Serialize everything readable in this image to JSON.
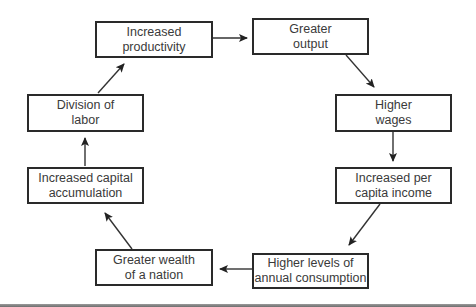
{
  "diagram": {
    "type": "cycle",
    "nodes": [
      {
        "id": "productivity",
        "lines": [
          "Increased",
          "productivity"
        ]
      },
      {
        "id": "output",
        "lines": [
          "Greater",
          "output"
        ]
      },
      {
        "id": "wages",
        "lines": [
          "Higher",
          "wages"
        ]
      },
      {
        "id": "income",
        "lines": [
          "Increased per",
          "capita income"
        ]
      },
      {
        "id": "consumption",
        "lines": [
          "Higher levels of",
          "annual consumption"
        ]
      },
      {
        "id": "wealth",
        "lines": [
          "Greater wealth",
          "of a nation"
        ]
      },
      {
        "id": "capital",
        "lines": [
          "Increased capital",
          "accumulation"
        ]
      },
      {
        "id": "division",
        "lines": [
          "Division of",
          "labor"
        ]
      }
    ],
    "edges": [
      {
        "from": "productivity",
        "to": "output"
      },
      {
        "from": "output",
        "to": "wages"
      },
      {
        "from": "wages",
        "to": "income"
      },
      {
        "from": "income",
        "to": "consumption"
      },
      {
        "from": "consumption",
        "to": "wealth"
      },
      {
        "from": "wealth",
        "to": "capital"
      },
      {
        "from": "capital",
        "to": "division"
      },
      {
        "from": "division",
        "to": "productivity"
      }
    ],
    "colors": {
      "border": "#2a2a2a",
      "text": "#3a3a3a",
      "background": "#ffffff"
    }
  }
}
